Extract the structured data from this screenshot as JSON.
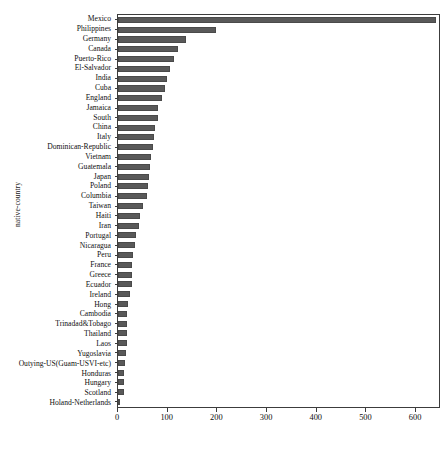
{
  "chart_data": {
    "type": "bar",
    "orientation": "horizontal",
    "title": "",
    "subtitle": "",
    "xlabel": "",
    "ylabel": "native-country",
    "xlim": [
      0,
      650
    ],
    "ylim": null,
    "grid": false,
    "legend": null,
    "bar_color": "#595959",
    "xticks": [
      0,
      100,
      200,
      300,
      400,
      500,
      600
    ],
    "xticklabels": [
      "0",
      "100",
      "200",
      "300",
      "400",
      "500",
      "600"
    ],
    "categories": [
      "Mexico",
      "Philippines",
      "Germany",
      "Canada",
      "Puerto-Rico",
      "El-Salvador",
      "India",
      "Cuba",
      "England",
      "Jamaica",
      "South",
      "China",
      "Italy",
      "Dominican-Republic",
      "Vietnam",
      "Guatemala",
      "Japan",
      "Poland",
      "Columbia",
      "Taiwan",
      "Haiti",
      "Iran",
      "Portugal",
      "Nicaragua",
      "Peru",
      "France",
      "Greece",
      "Ecuador",
      "Ireland",
      "Hong",
      "Cambodia",
      "Trinadad&Tobago",
      "Thailand",
      "Laos",
      "Yugoslavia",
      "Outying-US(Guam-USVI-etc)",
      "Honduras",
      "Hungary",
      "Scotland",
      "Holand-Netherlands"
    ],
    "values": [
      643,
      198,
      137,
      121,
      114,
      106,
      100,
      95,
      90,
      81,
      80,
      75,
      73,
      70,
      67,
      64,
      62,
      60,
      59,
      51,
      44,
      43,
      37,
      34,
      31,
      29,
      29,
      28,
      24,
      20,
      19,
      19,
      18,
      18,
      16,
      14,
      13,
      13,
      12,
      1
    ]
  },
  "caption": {
    "text": ""
  }
}
